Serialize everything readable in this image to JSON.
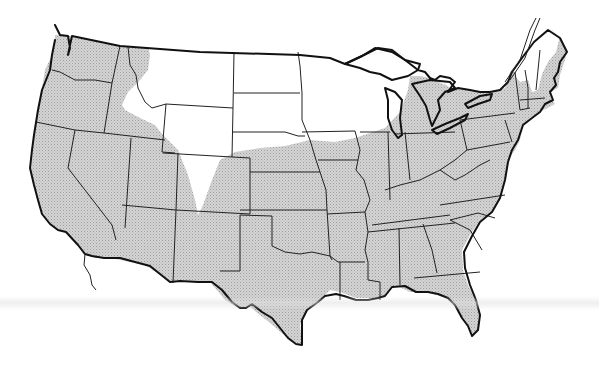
{
  "map": {
    "subject": "Conterminous United States range map",
    "legend": [],
    "colors": {
      "range_fill": "#cfcfcf",
      "range_hatch": "#a8a8a8",
      "outside_fill": "#ffffff",
      "boundary_stroke": "#1a1a1a"
    },
    "regions": {
      "shaded": "Range (most of the US: Pacific states, Southwest, South, Midwest, East)",
      "unshaded": [
        "Montana (most)",
        "Wyoming",
        "North Dakota",
        "South Dakota (north)",
        "Minnesota",
        "Wisconsin (north)",
        "Upper Michigan (east)",
        "Eastern Colorado / western Idaho wedge",
        "Northern New York (Adirondacks)",
        "Vermont / New Hampshire (north)",
        "Maine (west)"
      ]
    }
  }
}
